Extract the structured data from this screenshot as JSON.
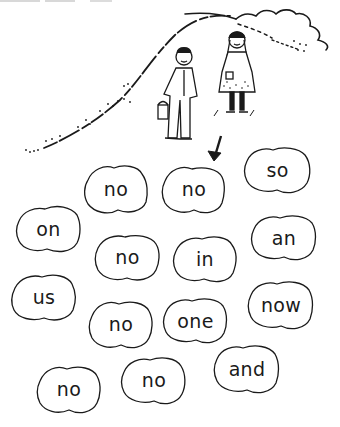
{
  "illustration": {
    "description": "Boy with pail and girl standing on a hill",
    "arrow_target": "blob-2"
  },
  "words": [
    {
      "id": "blob-1",
      "text": "no",
      "x": 82,
      "y": 162,
      "w": 68,
      "h": 53
    },
    {
      "id": "blob-2",
      "text": "no",
      "x": 160,
      "y": 163,
      "w": 68,
      "h": 52
    },
    {
      "id": "blob-3",
      "text": "so",
      "x": 243,
      "y": 145,
      "w": 69,
      "h": 50
    },
    {
      "id": "blob-4",
      "text": "on",
      "x": 15,
      "y": 203,
      "w": 67,
      "h": 51
    },
    {
      "id": "blob-5",
      "text": "no",
      "x": 93,
      "y": 232,
      "w": 69,
      "h": 50
    },
    {
      "id": "blob-6",
      "text": "in",
      "x": 172,
      "y": 233,
      "w": 66,
      "h": 51
    },
    {
      "id": "blob-7",
      "text": "an",
      "x": 250,
      "y": 213,
      "w": 68,
      "h": 49
    },
    {
      "id": "blob-8",
      "text": "us",
      "x": 10,
      "y": 272,
      "w": 68,
      "h": 50
    },
    {
      "id": "blob-9",
      "text": "no",
      "x": 87,
      "y": 298,
      "w": 68,
      "h": 52
    },
    {
      "id": "blob-10",
      "text": "one",
      "x": 162,
      "y": 296,
      "w": 67,
      "h": 49
    },
    {
      "id": "blob-11",
      "text": "now",
      "x": 247,
      "y": 279,
      "w": 68,
      "h": 52
    },
    {
      "id": "blob-12",
      "text": "no",
      "x": 35,
      "y": 363,
      "w": 68,
      "h": 52
    },
    {
      "id": "blob-13",
      "text": "no",
      "x": 120,
      "y": 354,
      "w": 68,
      "h": 52
    },
    {
      "id": "blob-14",
      "text": "and",
      "x": 213,
      "y": 343,
      "w": 68,
      "h": 52
    }
  ]
}
